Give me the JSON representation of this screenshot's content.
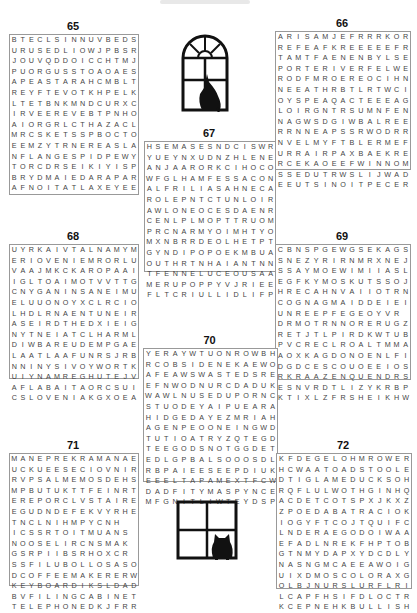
{
  "page": {
    "puzzles": [
      {
        "number": "65",
        "rows": [
          "BTECLSINNUVBEDS",
          "URUSEDLIOWJPBSR",
          "JOUVQDDOICCHTMJ",
          "PUORGUSSTOAOAES",
          "APEASTARAHCMBLT",
          "REYFTEVOTKHPELK",
          "LTETBNKMNDCURXC",
          "IRVEEREVEBTPNHO",
          "AIORGRLCTHAZACL",
          "MRCSKETSSPBOCTO",
          "EEMZYTRNEREASLAN",
          "NFLANGESPIDPEWY",
          "TORCDRSEIKIYISP",
          "BRYDMAIEDARAPAR",
          "AFNOITATLAXEYEE"
        ]
      },
      {
        "number": "66",
        "rows": [
          "ARISAMJEFRRRKOR",
          "REFEAFKREEEEEFR",
          "TAMTFAENENBYLSE",
          "PORTERIVERFELWE",
          "RODFMROEREOCIHN",
          "NEEATHRBTLRTWCI",
          "OYSPEAQACTEEEAG",
          "LOIRGNTRSUMNFEN",
          "NAGWSDGIWBALREE",
          "RRNNEAPSSRWODRR",
          "NVELMYFTBLERMEF",
          "URRAIRPAXBAEKRE",
          "RCEKAOEEFWINNOM",
          "SSEDUTRWSLIJWAD",
          "EEUTSINOITPECER"
        ]
      },
      {
        "number": "67",
        "rows": [
          "HSEMASESNDCISWR",
          "YUEYNXUDNZHLENE",
          "ANJAARORKCIHOCO",
          "WFGLHAMFESSACON",
          "ALFRILIASAHNECA",
          "ROLEPNTCTUNLOIR",
          "AWLONEOCESDAENR",
          "CENLPLMOPTTRUOM",
          "PRCNARMYOIMHTYO",
          "MXNBRRDEOLHETPT",
          "GYNDIPOPOEKMBUA",
          "OUTHRTNHAIANTNN",
          "TFENNELUCEOUSAA",
          "MERUPOPPYVJRIEE",
          "FLTCRIULLIDLIFP"
        ]
      },
      {
        "number": "68",
        "rows": [
          "UYRKAIVTALNAMYM",
          "ERIOVENIEMRORLU",
          "VAAJMKCKAROPAAI",
          "IGLTOAIMOTVVTTG",
          "CNYGANINSANEIMU",
          "ELUUONOYXCLRCIOI",
          "LHDLRNAENTUNEIR",
          "ASEIRDTHEDXIEIG",
          "NYTNEIATCLHARML",
          "DIWBAREUDEMPGAE",
          "LAATLAAFUNRSJRB",
          "NNINYSIVOYWORTKA",
          "UIYNAMREGHUTEJV",
          "AFLABAITAORCSUI",
          "CSLOVENIAKGXOEA"
        ]
      },
      {
        "number": "69",
        "rows": [
          "CBNSPGEWGSEKAGS",
          "SNEZYRIRNMRXNEJ",
          "SSAYMOEWIMIIASLF",
          "EGFKYMOSKUTSSOJ",
          "HRECAHNVAIIOTRN",
          "COGNAGMAIDDEIEI",
          "UNREEPFEGEOYVR",
          "DRMOTRNNORERUGZ",
          "RETJTLPIRDKWTUB",
          "PVCRECLROALTMMA",
          "AOXKAGDONOENLFI",
          "DGDCESCOUOEEIOS",
          "RKRAAZENQUENDRS",
          "ESNVRDTLIZYKRBP",
          "KTIXLZFRSHEIKHW"
        ]
      },
      {
        "number": "70",
        "rows": [
          "YERAYWTUONROWBH",
          "RCOBSIDENEKAEWO",
          "AFEAWSWASTEDSRE",
          "EFNWODNURCDADUK",
          "WAWLNUSEDUPORNC",
          "STUODEYAIPUEARA",
          "HIDGEDAYEZMRIAH",
          "AGENPEOONEINGWD",
          "TUTIOATRYZQTEGD",
          "TEEGODSNOTGGDET",
          "EDLGPBALSOOOSDL",
          "RBPAIEESEEPDIUK",
          "EEELTAPAMEXTFCW",
          "DADFITYMASPYNCE",
          "MFGNITLIWTEYDSP"
        ]
      },
      {
        "number": "71",
        "rows": [
          "MANEPREKRAMANAE",
          "UCKUEESECIOVNIR",
          "RVPSALMEMOSDEHS",
          "MPBUTUKTTFEINRT",
          "EREPORCLVSTAIRE",
          "EGUDNDEFEKVYRHEE",
          "TNCLNIHMPYCNH",
          "ICSSRTOITMUANS",
          "NOOSELIRCNSMAK",
          "GSRPIIBSRHOXCR",
          "SSFILUBOLLOSASO",
          "DCOFFEEMAKERERW",
          "KEYBOARDIKSLDAD",
          "BVFILINGCABINET",
          "TELEPHONEDKJFRR"
        ]
      },
      {
        "number": "72",
        "rows": [
          "KFDEGELOHMROWER",
          "HCWAATOADSTOOLE",
          "DTIGLAMEDUCKSOH",
          "RQFLULWOTHGINHQ",
          "ACDETCOTSPXJKXZ",
          "ZPOEDABATRACIOK",
          "IOGYFTCOJTQUIFC",
          "LNDERAEGODOIWAA",
          "EFADLNREKFHPTOB",
          "GTNMYDAPXYDCDLY",
          "NASNGMCAEEAWOIG",
          "UIXDMOSCOLORAXG",
          "OLBJNURSLURFLRI",
          "LCAPFHSIFDLOCTRP",
          "KCEPNEHKBULLISH"
        ]
      }
    ],
    "icons": {
      "top_window": "arched-window-with-cat-icon",
      "bottom_window": "square-window-with-cat-icon"
    }
  }
}
